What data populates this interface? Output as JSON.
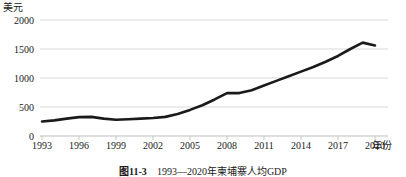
{
  "figure": {
    "caption_number": "图11-3",
    "caption_text": "1993—2020年柬埔寨人均GDP",
    "caption_full": "图11-3  1993—2020年柬埔寨人均GDP"
  },
  "axes": {
    "y_unit_label": "美元",
    "x_unit_label": "年份",
    "y_ticks": [
      "0",
      "500",
      "1000",
      "1500",
      "2000"
    ],
    "x_ticks": [
      "1993",
      "1996",
      "1999",
      "2002",
      "2005",
      "2008",
      "2011",
      "2014",
      "2017",
      "2020"
    ]
  },
  "style": {
    "line_color": "#1a1a1a",
    "grid_color": "#d9d9d9",
    "axis_color": "#bfbfbf",
    "background": "#ffffff"
  },
  "chart_data": {
    "type": "line",
    "title": "1993—2020年柬埔寨人均GDP",
    "xlabel": "年份",
    "ylabel": "美元",
    "xlim": [
      1993,
      2020
    ],
    "ylim": [
      0,
      2000
    ],
    "grid": true,
    "legend": "none",
    "x": [
      1993,
      1994,
      1995,
      1996,
      1997,
      1998,
      1999,
      2000,
      2001,
      2002,
      2003,
      2004,
      2005,
      2006,
      2007,
      2008,
      2009,
      2010,
      2011,
      2012,
      2013,
      2014,
      2015,
      2016,
      2017,
      2018,
      2019,
      2020
    ],
    "series": [
      {
        "name": "人均GDP",
        "values": [
          250,
          270,
          300,
          325,
          330,
          300,
          280,
          290,
          300,
          310,
          330,
          380,
          450,
          530,
          630,
          740,
          740,
          790,
          870,
          950,
          1030,
          1110,
          1190,
          1280,
          1380,
          1500,
          1610,
          1560
        ]
      }
    ]
  }
}
